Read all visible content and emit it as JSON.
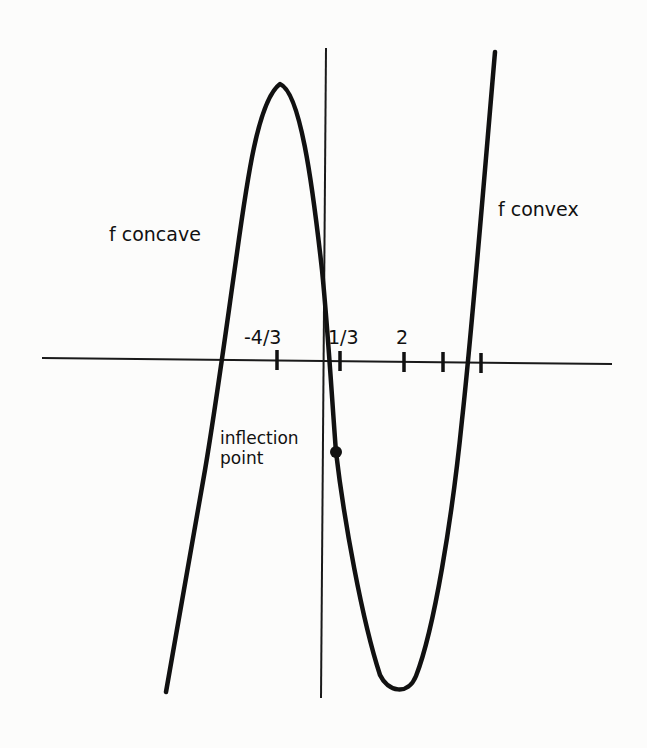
{
  "diagram": {
    "type": "function-graph",
    "colors": {
      "ink": "#111111",
      "background": "#fcfcfb"
    },
    "labels": {
      "left_region": "f concave",
      "right_region": "f convex",
      "inflection_line1": "inflection",
      "inflection_line2": "point"
    },
    "x_axis": {
      "tick_labels": [
        "-4/3",
        "1/3",
        "2"
      ],
      "ticks": [
        {
          "label": "-4/3",
          "px": 277
        },
        {
          "label": "1/3",
          "px": 340
        },
        {
          "label": "2",
          "px": 404
        },
        {
          "label": "",
          "px": 443
        },
        {
          "label": "",
          "px": 481
        }
      ]
    },
    "curve": {
      "left_end": [
        166,
        692
      ],
      "local_max": [
        280,
        84
      ],
      "inflection_point": [
        336,
        452
      ],
      "local_min": [
        398,
        690
      ],
      "right_end": [
        495,
        52
      ]
    }
  }
}
